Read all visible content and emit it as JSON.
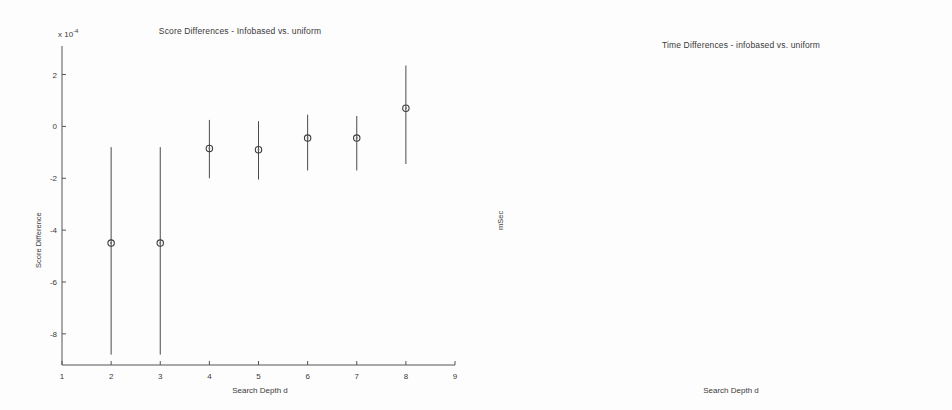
{
  "figure": {
    "background": "#fdfdfd",
    "line_color": "#4a4a4a",
    "text_color": "#3a3a3a"
  },
  "chart_data": [
    {
      "id": "score-differences",
      "type": "scatter",
      "title": "Score Differences - Infobased vs. uniform",
      "xlabel": "Search Depth d",
      "ylabel": "Score Difference",
      "exponent_label": "x 10",
      "exponent_value": "-4",
      "xlim": [
        1,
        9
      ],
      "ylim": [
        -9.2,
        3.1
      ],
      "xticks": [
        1,
        2,
        3,
        4,
        5,
        6,
        7,
        8,
        9
      ],
      "xticklabels": [
        "1",
        "2",
        "3",
        "4",
        "5",
        "6",
        "7",
        "8",
        "9"
      ],
      "yticks": [
        2,
        0,
        -2,
        -4,
        -6,
        -8
      ],
      "yticklabels": [
        "2",
        "0",
        "-2",
        "-4",
        "-6",
        "-8"
      ],
      "grid": false,
      "legend": "none",
      "x": [
        2,
        3,
        4,
        5,
        6,
        7,
        8
      ],
      "values": [
        -4.5,
        -4.5,
        -0.85,
        -0.9,
        -0.45,
        -0.45,
        0.7
      ],
      "err_low": [
        -8.8,
        -8.8,
        -2.0,
        -2.05,
        -1.7,
        -1.7,
        -1.45
      ],
      "err_high": [
        -0.8,
        -0.8,
        0.25,
        0.2,
        0.45,
        0.4,
        2.35
      ],
      "units": "1e-4"
    },
    {
      "id": "time-differences",
      "type": "scatter",
      "title": "Time Differences - infobased vs. uniform",
      "xlabel": "Search Depth d",
      "ylabel": "mSec",
      "xlim": [
        1,
        9
      ],
      "ylim": [
        -19000,
        900
      ],
      "xticks": [
        1,
        2,
        3,
        4,
        5,
        6,
        7,
        8,
        9
      ],
      "xticklabels": [
        "1",
        "2",
        "3",
        "4",
        "5",
        "6",
        "7",
        "8",
        "9"
      ],
      "yticks": [
        0,
        -2000,
        -4000,
        -6000,
        -8000,
        -10000,
        -12000,
        -14000,
        -16000,
        -18000
      ],
      "yticklabels": [
        "0",
        "-2000",
        "-4000",
        "-6000",
        "-8000",
        "-10000",
        "-12000",
        "-14000",
        "-16000",
        "-18000"
      ],
      "grid": false,
      "legend": "none",
      "x": [
        2,
        3,
        4,
        5,
        6,
        7,
        8
      ],
      "values": [
        -30,
        -60,
        -80,
        -200,
        -640,
        -4100,
        -16800
      ],
      "err_low": [
        -90,
        -140,
        -190,
        -360,
        -860,
        -4500,
        -18400
      ],
      "err_high": [
        30,
        20,
        30,
        -40,
        -420,
        -3700,
        -15300
      ],
      "units": "mSec"
    }
  ]
}
